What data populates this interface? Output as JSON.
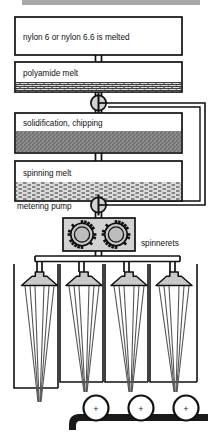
{
  "diagram": {
    "topbar": {
      "name": "page-header-bar",
      "color": "#a8a8a8"
    },
    "colors": {
      "line": "#1a1a1a",
      "box_fill": "#ffffff",
      "chips_fill": "#8c8c8c",
      "melt_fill": "#c9c9c9",
      "spinneret_fill": "#cfcfcf",
      "pump_fill": "#d2d2d2",
      "belt": "#1a1a1a",
      "filament": "#555555"
    },
    "boxes": [
      {
        "id": "melter",
        "label": "nylon 6 or nylon 6.6 is melted",
        "fill": "none"
      },
      {
        "id": "polyamide_melt",
        "label": "polyamide melt",
        "fill": "brick"
      },
      {
        "id": "solidification",
        "label": "solidification, chipping",
        "fill": "chips"
      },
      {
        "id": "spinning_melt",
        "label": "spinning melt",
        "fill": "liquid"
      }
    ],
    "labels": {
      "metering_pump": "metering pump",
      "spinnerets": "spinnerets"
    },
    "pumps": [
      {
        "id": "pump-upper",
        "name": "pump-symbol-upper"
      },
      {
        "id": "pump-lower",
        "name": "pump-symbol-lower"
      }
    ],
    "metering_pump_unit": {
      "gear_count": 2,
      "name": "gear-pump"
    },
    "spinneret_units": {
      "count": 4,
      "filaments_per_unit": 6
    },
    "bobbins": {
      "count": 3,
      "marker": "+"
    },
    "bypass_line": {
      "name": "recycle-bypass-line"
    }
  }
}
